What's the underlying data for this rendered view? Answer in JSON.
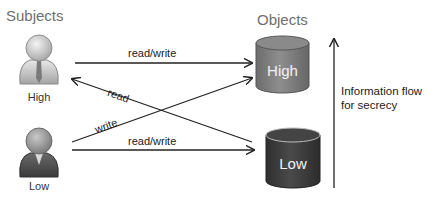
{
  "diagram": {
    "subjects_heading": "Subjects",
    "objects_heading": "Objects",
    "subjects": [
      {
        "label": "High",
        "icon": "user-icon"
      },
      {
        "label": "Low",
        "icon": "user-icon"
      }
    ],
    "objects": [
      {
        "label": "High",
        "icon": "database-cylinder-icon",
        "color": "#7d7d7d"
      },
      {
        "label": "Low",
        "icon": "database-cylinder-icon",
        "color": "#3f3f3f"
      }
    ],
    "arrows": [
      {
        "from": "High subject",
        "to": "High object",
        "label": "read/write"
      },
      {
        "from": "High object",
        "to": "High subject",
        "label": "read"
      },
      {
        "from": "Low subject",
        "to": "High object",
        "label": "write"
      },
      {
        "from": "Low subject",
        "to": "Low object",
        "label": "read/write"
      }
    ],
    "flow": {
      "line1": "Information flow",
      "line2": "for secrecy",
      "direction": "up"
    }
  }
}
